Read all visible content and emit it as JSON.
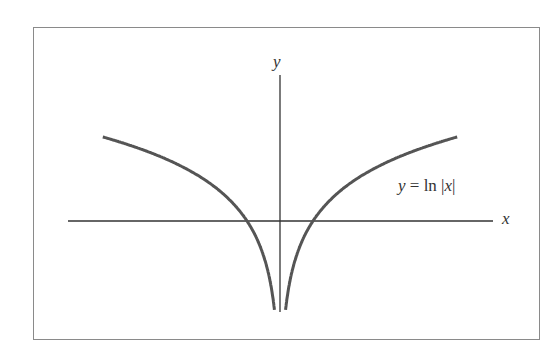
{
  "chart_data": {
    "type": "line",
    "title": "",
    "function": "y = ln |x|",
    "series": [
      {
        "name": "y = ln |x|",
        "x": [
          -5.4,
          -4,
          -3,
          -2,
          -1,
          -0.5,
          -0.2,
          0.2,
          0.5,
          1,
          2,
          3,
          4,
          5.4
        ],
        "values": [
          1.69,
          1.39,
          1.1,
          0.69,
          0,
          -0.69,
          -1.61,
          -1.61,
          -0.69,
          0,
          0.69,
          1.1,
          1.39,
          1.69
        ]
      }
    ],
    "xlabel": "x",
    "ylabel": "y",
    "annotations": [
      "y = ln |x|"
    ],
    "grid": false,
    "legend": "none"
  },
  "labels": {
    "x_axis": "x",
    "y_axis": "y",
    "eq_y": "y",
    "eq_mid": " = ln |",
    "eq_x": "x",
    "eq_end": "|"
  },
  "colors": {
    "curve": "#555555",
    "axis": "#333333",
    "frame": "#8a8a8a"
  }
}
